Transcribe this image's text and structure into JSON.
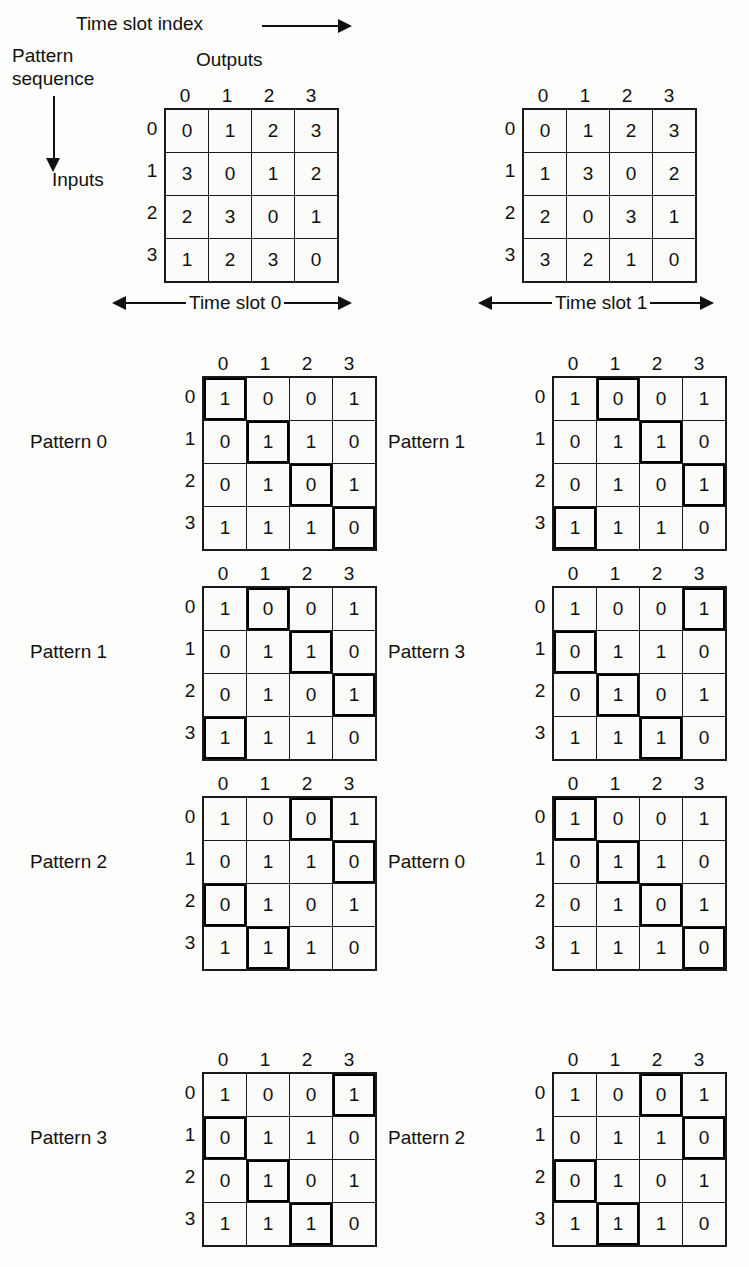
{
  "figure": {
    "top_axis_label": "Time slot index",
    "left_axis_label_line1": "Pattern",
    "left_axis_label_line2": "sequence",
    "outputs_label": "Outputs",
    "inputs_label": "Inputs",
    "column_indices": [
      "0",
      "1",
      "2",
      "3"
    ],
    "row_indices": [
      "0",
      "1",
      "2",
      "3"
    ]
  },
  "allocation_matrices": [
    {
      "name": "allocation-matrix-slot-0",
      "rows": [
        [
          "0",
          "1",
          "2",
          "3"
        ],
        [
          "3",
          "0",
          "1",
          "2"
        ],
        [
          "2",
          "3",
          "0",
          "1"
        ],
        [
          "1",
          "2",
          "3",
          "0"
        ]
      ]
    },
    {
      "name": "allocation-matrix-slot-1",
      "rows": [
        [
          "0",
          "1",
          "2",
          "3"
        ],
        [
          "1",
          "3",
          "0",
          "2"
        ],
        [
          "2",
          "0",
          "3",
          "1"
        ],
        [
          "3",
          "2",
          "1",
          "0"
        ]
      ]
    }
  ],
  "time_slots": [
    {
      "label": "Time slot 0"
    },
    {
      "label": "Time slot 1"
    }
  ],
  "pattern_matrix_values": [
    [
      "1",
      "0",
      "0",
      "1"
    ],
    [
      "0",
      "1",
      "1",
      "0"
    ],
    [
      "0",
      "1",
      "0",
      "1"
    ],
    [
      "1",
      "1",
      "1",
      "0"
    ]
  ],
  "pattern_grids": [
    {
      "label": "Pattern 0",
      "column": "left",
      "order": 0,
      "highlight": [
        0,
        1,
        2,
        3
      ],
      "values": [
        [
          "1",
          "0",
          "0",
          "1"
        ],
        [
          "0",
          "1",
          "1",
          "0"
        ],
        [
          "0",
          "1",
          "0",
          "1"
        ],
        [
          "1",
          "1",
          "1",
          "0"
        ]
      ]
    },
    {
      "label": "Pattern 1",
      "column": "right",
      "order": 0,
      "highlight": [
        1,
        2,
        3,
        0
      ],
      "values": [
        [
          "1",
          "0",
          "0",
          "1"
        ],
        [
          "0",
          "1",
          "1",
          "0"
        ],
        [
          "0",
          "1",
          "0",
          "1"
        ],
        [
          "1",
          "1",
          "1",
          "0"
        ]
      ]
    },
    {
      "label": "Pattern 1",
      "column": "left",
      "order": 1,
      "highlight": [
        1,
        2,
        3,
        0
      ],
      "values": [
        [
          "1",
          "0",
          "0",
          "1"
        ],
        [
          "0",
          "1",
          "1",
          "0"
        ],
        [
          "0",
          "1",
          "0",
          "1"
        ],
        [
          "1",
          "1",
          "1",
          "0"
        ]
      ]
    },
    {
      "label": "Pattern 3",
      "column": "right",
      "order": 1,
      "highlight": [
        3,
        0,
        1,
        2
      ],
      "values": [
        [
          "1",
          "0",
          "0",
          "1"
        ],
        [
          "0",
          "1",
          "1",
          "0"
        ],
        [
          "0",
          "1",
          "0",
          "1"
        ],
        [
          "1",
          "1",
          "1",
          "0"
        ]
      ]
    },
    {
      "label": "Pattern 2",
      "column": "left",
      "order": 2,
      "highlight": [
        2,
        3,
        0,
        1
      ],
      "values": [
        [
          "1",
          "0",
          "0",
          "1"
        ],
        [
          "0",
          "1",
          "1",
          "0"
        ],
        [
          "0",
          "1",
          "0",
          "1"
        ],
        [
          "1",
          "1",
          "1",
          "0"
        ]
      ]
    },
    {
      "label": "Pattern 0",
      "column": "right",
      "order": 2,
      "highlight": [
        0,
        1,
        2,
        3
      ],
      "values": [
        [
          "1",
          "0",
          "0",
          "1"
        ],
        [
          "0",
          "1",
          "1",
          "0"
        ],
        [
          "0",
          "1",
          "0",
          "1"
        ],
        [
          "1",
          "1",
          "1",
          "0"
        ]
      ]
    },
    {
      "label": "Pattern 3",
      "column": "left",
      "order": 3,
      "highlight": [
        3,
        0,
        1,
        2
      ],
      "values": [
        [
          "1",
          "0",
          "0",
          "1"
        ],
        [
          "0",
          "1",
          "1",
          "0"
        ],
        [
          "0",
          "1",
          "0",
          "1"
        ],
        [
          "1",
          "1",
          "1",
          "0"
        ]
      ]
    },
    {
      "label": "Pattern 2",
      "column": "right",
      "order": 3,
      "highlight": [
        2,
        3,
        0,
        1
      ],
      "values": [
        [
          "1",
          "0",
          "0",
          "1"
        ],
        [
          "0",
          "1",
          "1",
          "0"
        ],
        [
          "0",
          "1",
          "0",
          "1"
        ],
        [
          "1",
          "1",
          "1",
          "0"
        ]
      ]
    }
  ],
  "colors": {
    "ink": "#111111",
    "paper": "#fdfdfb",
    "cell_fill": "#fbfbf9"
  }
}
